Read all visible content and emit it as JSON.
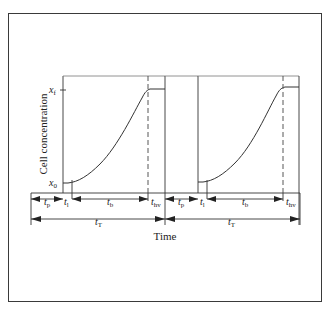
{
  "diagram": {
    "type": "batch-cycle-timing",
    "y_axis_label": "Cell concentration",
    "x_axis_label": "Time",
    "y_markers": {
      "final": {
        "main": "x",
        "sub": "f"
      },
      "initial": {
        "main": "x",
        "sub": "0"
      }
    },
    "cycles": [
      {
        "intervals": [
          {
            "main": "t",
            "sub": "p"
          },
          {
            "main": "t",
            "sub": "l"
          },
          {
            "main": "t",
            "sub": "b"
          },
          {
            "main": "t",
            "sub": "hv"
          }
        ],
        "total": {
          "main": "t",
          "sub": "T"
        }
      },
      {
        "intervals": [
          {
            "main": "t",
            "sub": "p"
          },
          {
            "main": "t",
            "sub": "l"
          },
          {
            "main": "t",
            "sub": "b"
          },
          {
            "main": "t",
            "sub": "hv"
          }
        ],
        "total": {
          "main": "t",
          "sub": "T"
        }
      }
    ],
    "colors": {
      "line": "#333333",
      "frame": "#3a3a3a",
      "background": "#ffffff"
    }
  }
}
